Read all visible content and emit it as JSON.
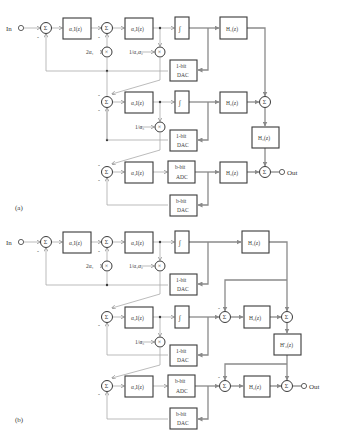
{
  "figure": {
    "panels": [
      {
        "id": "a",
        "label": "(a)",
        "input_label": "In",
        "output_label": "Out",
        "integrators": [
          "α₁I(z)",
          "α₂I(z)",
          "α₃I(z)",
          "α₄I(z)"
        ],
        "gains": [
          "2α₁",
          "1/α₁α₂",
          "1/α₃"
        ],
        "quantizers": [
          "∫",
          "∫"
        ],
        "converters": [
          "1-bit DAC",
          "1-bit DAC",
          "b-bit ADC",
          "b-bit DAC"
        ],
        "filters": [
          "H₁(z)",
          "H₂(z)",
          "H₃(z)",
          "H₃(z)"
        ]
      },
      {
        "id": "b",
        "label": "(b)",
        "input_label": "In",
        "output_label": "Out",
        "integrators": [
          "α₁I(z)",
          "α₂I(z)",
          "α₃I(z)",
          "α₄I(z)"
        ],
        "gains": [
          "2α₁",
          "1/α₁α₂",
          "1/α₃"
        ],
        "quantizers": [
          "∫",
          "∫"
        ],
        "converters": [
          "1-bit DAC",
          "1-bit DAC",
          "b-bit ADC",
          "b-bit DAC"
        ],
        "filters": [
          "H₁(z)",
          "H₂(z)",
          "H'₃(z)",
          "H₂(z)"
        ]
      }
    ],
    "symbols": {
      "sum": "Σ",
      "multiply": "×",
      "minus": "-"
    },
    "text": {
      "a_in": "In",
      "a_out": "Out",
      "a_int1": "α₁I(z)",
      "a_int2": "α₂I(z)",
      "a_int3": "α₃I(z)",
      "a_int4": "α₄I(z)",
      "a_g1": "2α₁",
      "a_g2": "1/α₁α₂",
      "a_g3": "1/α₃",
      "a_dac1_top": "1-bit",
      "a_dac1_bot": "DAC",
      "a_dac2_top": "1-bit",
      "a_dac2_bot": "DAC",
      "a_adc_top": "b-bit",
      "a_adc_bot": "ADC",
      "a_dac3_top": "b-bit",
      "a_dac3_bot": "DAC",
      "a_h1": "H₁(z)",
      "a_h2": "H₂(z)",
      "a_h3a": "H₃(z)",
      "a_h3b": "H₃(z)",
      "a_label": "(a)",
      "b_in": "In",
      "b_out": "Out",
      "b_int1": "α₁I(z)",
      "b_int2": "α₂I(z)",
      "b_int3": "α₃I(z)",
      "b_int4": "α₄I(z)",
      "b_g1": "2α₁",
      "b_g2": "1/α₁α₂",
      "b_g3": "1/α₃",
      "b_dac1_top": "1-bit",
      "b_dac1_bot": "DAC",
      "b_dac2_top": "1-bit",
      "b_dac2_bot": "DAC",
      "b_adc_top": "b-bit",
      "b_adc_bot": "ADC",
      "b_dac3_top": "b-bit",
      "b_dac3_bot": "DAC",
      "b_h1": "H₁(z)",
      "b_h2a": "H₂(z)",
      "b_h3p": "H'₃(z)",
      "b_h2b": "H₂(z)",
      "b_label": "(b)",
      "sigma": "Σ",
      "times": "×",
      "minus": "-",
      "quant": "∫"
    },
    "colors": {
      "block_stroke": "#3a3a3a",
      "wire": "#8a8a8a",
      "background": "#ffffff"
    }
  }
}
